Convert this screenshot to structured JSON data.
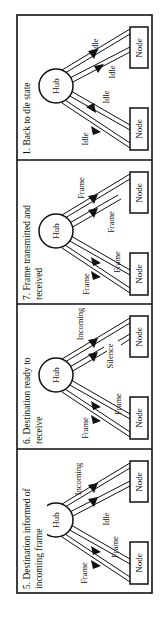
{
  "figure": {
    "orientation": "rotated-90-ccw",
    "panels": [
      {
        "id": "panel-1",
        "title_lines": [
          "1. Back to dle state"
        ],
        "hub_label": "Hub",
        "nodes": [
          "Node",
          "Node"
        ],
        "labels": {
          "upper_out": "Idle",
          "upper_in": "Idle",
          "lower_out": "Idle",
          "lower_in": "Idle"
        }
      },
      {
        "id": "panel-7",
        "title_lines": [
          "7. Frame transmitted and",
          "received"
        ],
        "hub_label": "Hub",
        "nodes": [
          "Node",
          "Node"
        ],
        "labels": {
          "upper_out": "Frame",
          "upper_in": "Frame",
          "lower_out": "Frame",
          "lower_in": "Frame"
        }
      },
      {
        "id": "panel-6",
        "title_lines": [
          "6. Destination ready to",
          "receive"
        ],
        "hub_label": "Hub",
        "nodes": [
          "Node",
          "Node"
        ],
        "labels": {
          "upper_out": "Incoming",
          "upper_in": "Silence",
          "lower_out": "Frame",
          "lower_in": "Frame"
        }
      },
      {
        "id": "panel-5",
        "title_lines": [
          "5. Destination informed of",
          "incoming frame"
        ],
        "hub_label": "Hub",
        "nodes": [
          "Node",
          "Node"
        ],
        "labels": {
          "upper_out": "Incoming",
          "upper_in": "Idle",
          "lower_out": "Frame",
          "lower_in": "Frame"
        }
      }
    ]
  }
}
